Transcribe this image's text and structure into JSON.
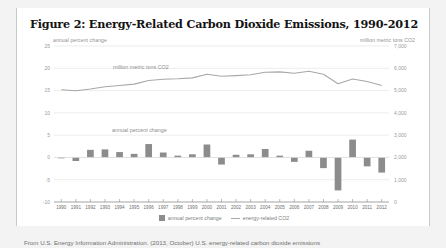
{
  "figure": {
    "title": "Figure 2: Energy-Related Carbon Dioxide Emissions, 1990-2012",
    "left_axis_caption": "annual percent change",
    "right_axis_caption": "million metric tons CO2",
    "note_line": "million metric tons CO2",
    "note_bars": "annual percent change",
    "source_note": "From U.S. Energy Information Administration. (2013, October) U.S. energy-related carbon dioxide emissions"
  },
  "legend": {
    "items": [
      {
        "label": "annual percent change",
        "marker": "bar-swatch",
        "color": "#8c8c8c"
      },
      {
        "label": "energy-related CO2",
        "marker": "line-swatch",
        "color": "#a8a8a8"
      }
    ]
  },
  "colors": {
    "bar": "#8c8c8c",
    "line": "#a8a8a8",
    "grid": "#e4e4e4",
    "axis_text": "#9a9a9a",
    "card": "#ffffff",
    "page": "#f3f3f3"
  },
  "chart_data": {
    "type": "bar",
    "title": "Figure 2: Energy-Related Carbon Dioxide Emissions, 1990-2012",
    "xlabel": "",
    "ylabel": "annual percent change",
    "y2label": "million metric tons CO2",
    "ylim": [
      -10,
      25
    ],
    "y2lim": [
      0,
      7000
    ],
    "yticks": [
      -10,
      -5,
      0,
      5,
      10,
      15,
      20,
      25
    ],
    "y2ticks": [
      0,
      1000,
      2000,
      3000,
      4000,
      5000,
      6000,
      7000
    ],
    "ytick_labels": [
      "-10",
      "-5",
      "0",
      "5",
      "10",
      "15",
      "20",
      "25"
    ],
    "y2tick_labels": [
      "0",
      "1,000",
      "2,000",
      "3,000",
      "4,000",
      "5,000",
      "6,000",
      "7,000"
    ],
    "grid": true,
    "legend_position": "bottom-center",
    "categories": [
      "1990",
      "1991",
      "1992",
      "1993",
      "1994",
      "1995",
      "1996",
      "1997",
      "1998",
      "1999",
      "2000",
      "2001",
      "2002",
      "2003",
      "2004",
      "2005",
      "2006",
      "2007",
      "2008",
      "2009",
      "2010",
      "2011",
      "2012"
    ],
    "series": [
      {
        "name": "annual percent change",
        "type": "bar",
        "axis": "left",
        "values": [
          0.0,
          -0.8,
          1.7,
          1.8,
          1.2,
          0.8,
          3.0,
          1.1,
          0.4,
          0.7,
          2.9,
          -1.6,
          0.6,
          0.7,
          1.9,
          0.4,
          -1.0,
          1.5,
          -2.4,
          -7.4,
          4.0,
          -2.0,
          -3.4
        ]
      },
      {
        "name": "energy-related CO2",
        "type": "line",
        "axis": "right",
        "values": [
          5040,
          4990,
          5070,
          5170,
          5230,
          5290,
          5450,
          5510,
          5530,
          5570,
          5730,
          5640,
          5670,
          5710,
          5820,
          5840,
          5780,
          5870,
          5730,
          5310,
          5520,
          5410,
          5230
        ]
      }
    ]
  }
}
